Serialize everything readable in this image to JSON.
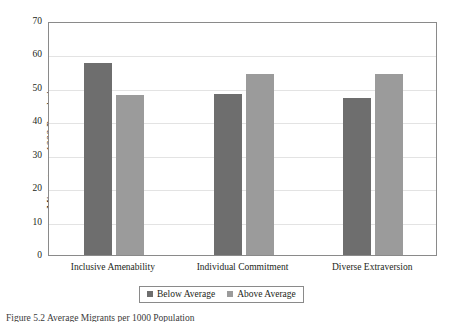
{
  "chart_data": {
    "type": "bar",
    "title": "",
    "subtitle": "",
    "xlabel": "",
    "ylabel": "Migrants per 1000 Population",
    "categories": [
      "Inclusive Amenability",
      "Individual Commitment",
      "Diverse Extraversion"
    ],
    "series": [
      {
        "name": "Below Average",
        "color": "#6e6e6e",
        "values": [
          57.4,
          48.3,
          47.0
        ]
      },
      {
        "name": "Above Average",
        "color": "#9b9b9b",
        "values": [
          47.9,
          54.1,
          54.1
        ]
      }
    ],
    "ylim": [
      0,
      70
    ],
    "ytick_values": [
      0,
      10,
      20,
      30,
      40,
      50,
      60,
      70
    ],
    "ytick_labels": [
      "0",
      "10",
      "20",
      "30",
      "40",
      "50",
      "60",
      "70"
    ],
    "grid": "horizontal",
    "legend_position": "bottom-center",
    "legend_entries": [
      "Below Average",
      "Above Average"
    ],
    "annotations": []
  },
  "caption": {
    "text": "Figure 5.2 Average Migrants per 1000 Population"
  }
}
